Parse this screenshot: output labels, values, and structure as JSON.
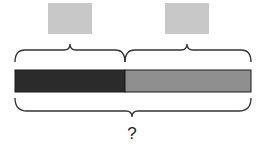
{
  "diagram": {
    "type": "tape-diagram",
    "top_boxes": [
      {
        "label": "",
        "color": "#c8c8c8",
        "x": 48
      },
      {
        "label": "",
        "color": "#c8c8c8",
        "x": 165
      }
    ],
    "bar": {
      "segments": [
        {
          "color": "#2b2b2b",
          "x": 15,
          "width": 110
        },
        {
          "color": "#8f8f8f",
          "x": 125,
          "width": 126
        }
      ],
      "border_color": "#1a1a1a"
    },
    "total_label": "?"
  }
}
